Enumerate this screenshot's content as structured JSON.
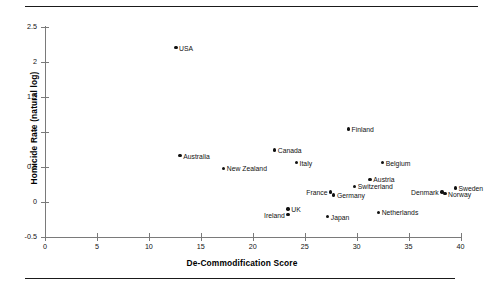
{
  "figure": {
    "has_top_rule": true,
    "has_bottom_rule": true
  },
  "chart_data": {
    "type": "scatter",
    "title": "",
    "xlabel": "De-Commodification Score",
    "ylabel": "Homicide Rate (natural log)",
    "xlim": [
      0,
      40
    ],
    "ylim": [
      -0.5,
      2.5
    ],
    "xticks": [
      0,
      5,
      10,
      15,
      20,
      25,
      30,
      35,
      40
    ],
    "xticklabels": [
      "0",
      "5",
      "10",
      "15",
      "20",
      "25",
      "30",
      "35",
      "40"
    ],
    "yticks": [
      -0.5,
      0,
      0.5,
      1,
      1.5,
      2,
      2.5
    ],
    "yticklabels": [
      "-0.5",
      "0",
      "0.5",
      "1",
      "1.5",
      "2",
      "2.5"
    ],
    "grid": false,
    "legend": null,
    "marker_color": "#111111",
    "points": [
      {
        "label": "USA",
        "x": 12.6,
        "y": 2.2,
        "label_side": "right"
      },
      {
        "label": "Australia",
        "x": 13.0,
        "y": 0.66,
        "label_side": "right"
      },
      {
        "label": "New Zealand",
        "x": 17.2,
        "y": 0.48,
        "label_side": "right"
      },
      {
        "label": "Canada",
        "x": 22.1,
        "y": 0.74,
        "label_side": "right"
      },
      {
        "label": "Italy",
        "x": 24.2,
        "y": 0.56,
        "label_side": "right"
      },
      {
        "label": "Finland",
        "x": 29.2,
        "y": 1.04,
        "label_side": "right"
      },
      {
        "label": "Belgium",
        "x": 32.5,
        "y": 0.56,
        "label_side": "right"
      },
      {
        "label": "Austria",
        "x": 31.3,
        "y": 0.32,
        "label_side": "right"
      },
      {
        "label": "Switzerland",
        "x": 29.8,
        "y": 0.22,
        "label_side": "right"
      },
      {
        "label": "France",
        "x": 27.5,
        "y": 0.14,
        "label_side": "left"
      },
      {
        "label": "Germany",
        "x": 27.8,
        "y": 0.1,
        "label_side": "right"
      },
      {
        "label": "UK",
        "x": 23.4,
        "y": -0.1,
        "label_side": "right"
      },
      {
        "label": "Ireland",
        "x": 23.4,
        "y": -0.18,
        "label_side": "left"
      },
      {
        "label": "Japan",
        "x": 27.2,
        "y": -0.21,
        "label_side": "right"
      },
      {
        "label": "Netherlands",
        "x": 32.1,
        "y": -0.15,
        "label_side": "right"
      },
      {
        "label": "Denmark",
        "x": 38.2,
        "y": 0.14,
        "label_side": "left"
      },
      {
        "label": "Norway",
        "x": 38.5,
        "y": 0.12,
        "label_side": "right"
      },
      {
        "label": "Sweden",
        "x": 39.5,
        "y": 0.2,
        "label_side": "right"
      }
    ]
  }
}
